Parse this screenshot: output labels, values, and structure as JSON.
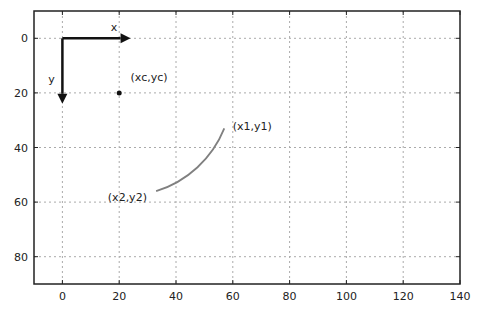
{
  "chart_data": {
    "type": "line",
    "title": "",
    "xlabel": "",
    "ylabel": "",
    "xlim": [
      -10,
      140
    ],
    "ylim": [
      90,
      -10
    ],
    "y_inverted": true,
    "grid": true,
    "x_ticks": [
      0,
      20,
      40,
      60,
      80,
      100,
      120,
      140
    ],
    "y_ticks": [
      0,
      20,
      40,
      60,
      80
    ],
    "axis_arrows": [
      {
        "label": "x",
        "from": [
          0,
          0
        ],
        "to": [
          24,
          0
        ]
      },
      {
        "label": "y",
        "from": [
          0,
          0
        ],
        "to": [
          0,
          24
        ]
      }
    ],
    "points": [
      {
        "label": "(xc,yc)",
        "x": 20,
        "y": 20
      }
    ],
    "arc": {
      "center": [
        20,
        20
      ],
      "radius": 38,
      "start_label": "(x1,y1)",
      "end_label": "(x2,y2)",
      "start_point": [
        57,
        33
      ],
      "end_point": [
        33,
        56
      ],
      "color": "#808080"
    },
    "annotations": [
      {
        "text": "x",
        "x": 17,
        "y": -4
      },
      {
        "text": "y",
        "x": -5,
        "y": 15
      },
      {
        "text": "(xc,yc)",
        "x": 24,
        "y": 14
      },
      {
        "text": "(x1,y1)",
        "x": 60,
        "y": 32
      },
      {
        "text": "(x2,y2)",
        "x": 16,
        "y": 58
      }
    ]
  }
}
